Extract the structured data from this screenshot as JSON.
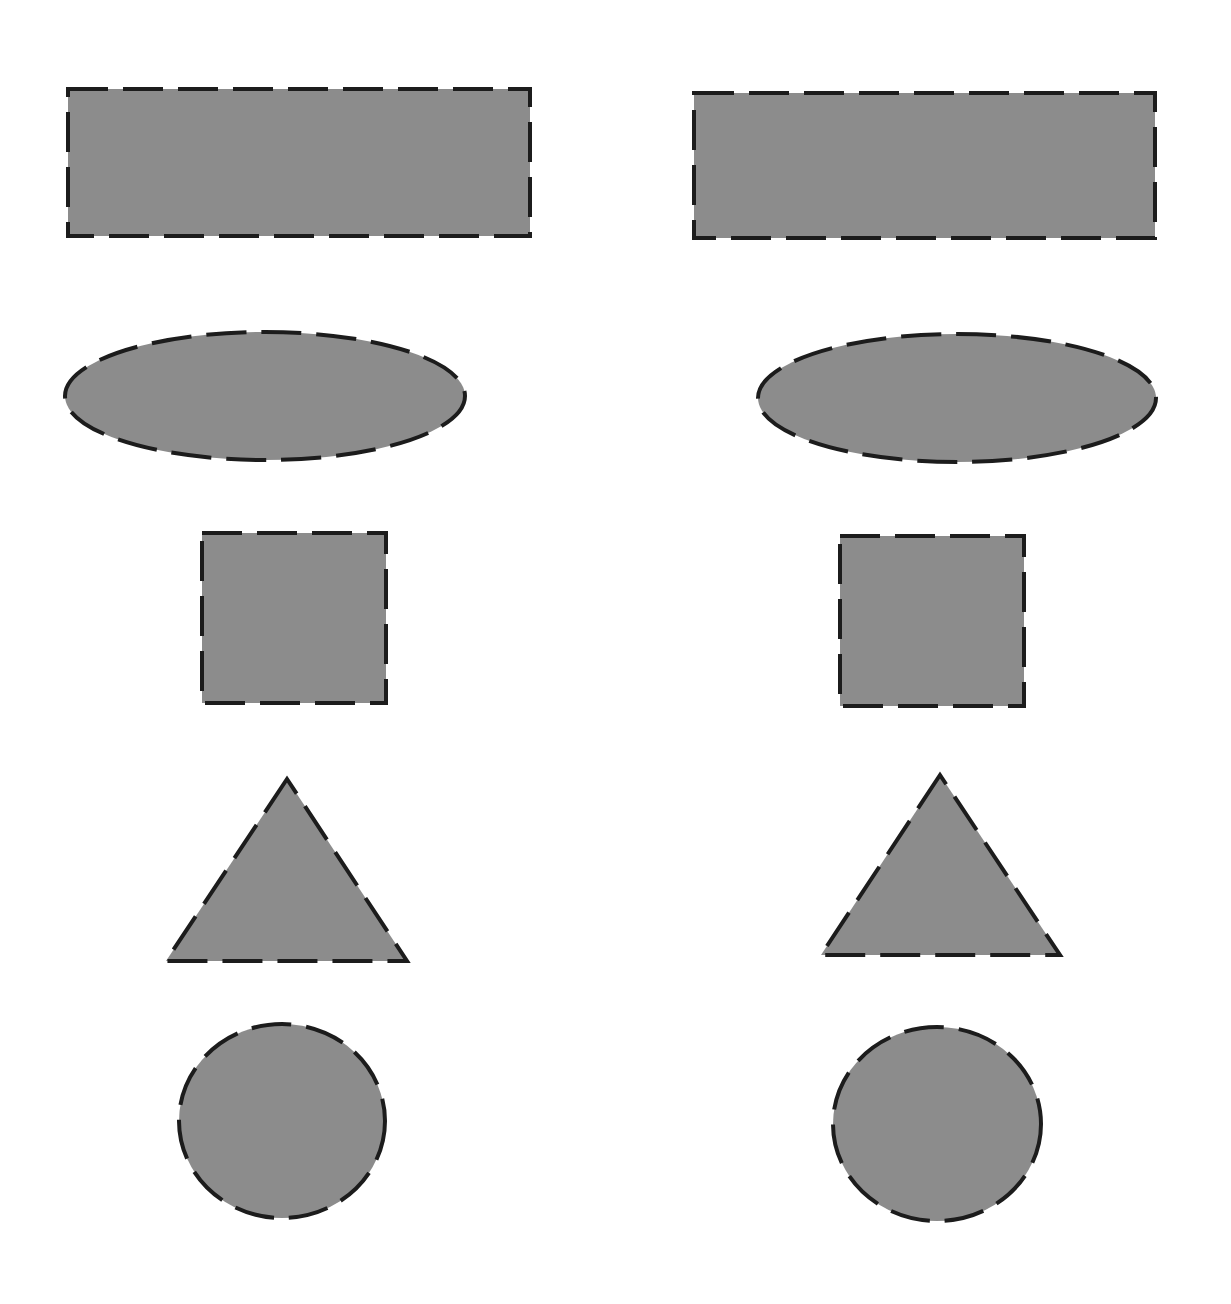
{
  "canvas": {
    "width": 1231,
    "height": 1304,
    "background": "#ffffff"
  },
  "style": {
    "fill": "#8c8c8c",
    "stroke": "#1c1c1c",
    "stroke_width": 4,
    "dash": "40 15"
  },
  "columns": [
    {
      "name": "left",
      "shapes": [
        {
          "type": "rectangle",
          "x": 68,
          "y": 89,
          "width": 462,
          "height": 147
        },
        {
          "type": "ellipse",
          "cx": 265,
          "cy": 396,
          "rx": 200,
          "ry": 64
        },
        {
          "type": "square",
          "x": 202,
          "y": 533,
          "width": 184,
          "height": 170
        },
        {
          "type": "triangle",
          "points": "287,779 166,961 407,961"
        },
        {
          "type": "circle",
          "cx": 282,
          "cy": 1121,
          "rx": 103,
          "ry": 97
        }
      ]
    },
    {
      "name": "right",
      "shapes": [
        {
          "type": "rectangle",
          "x": 694,
          "y": 93,
          "width": 461,
          "height": 145
        },
        {
          "type": "ellipse",
          "cx": 957,
          "cy": 398,
          "rx": 199,
          "ry": 64
        },
        {
          "type": "square",
          "x": 840,
          "y": 536,
          "width": 184,
          "height": 170
        },
        {
          "type": "triangle",
          "points": "940,775 821,955 1060,955"
        },
        {
          "type": "circle",
          "cx": 937,
          "cy": 1124,
          "rx": 104,
          "ry": 97
        }
      ]
    }
  ]
}
